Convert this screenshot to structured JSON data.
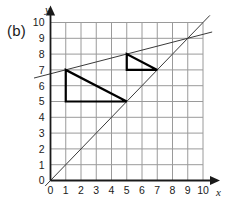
{
  "figure": {
    "panel_label": "(b)",
    "axis_x_name": "x",
    "axis_y_name": "y"
  },
  "chart_data": {
    "type": "scatter",
    "title": "(b)",
    "xlabel": "x",
    "ylabel": "y",
    "xlim": [
      0,
      10
    ],
    "ylim": [
      0,
      10
    ],
    "grid": true,
    "legend": "none",
    "x_ticks": [
      "0",
      "1",
      "2",
      "3",
      "4",
      "5",
      "6",
      "7",
      "8",
      "9",
      "10"
    ],
    "y_ticks": [
      "0",
      "1",
      "2",
      "3",
      "4",
      "5",
      "6",
      "7",
      "8",
      "9",
      "10"
    ],
    "x_tick_values": [
      0,
      1,
      2,
      3,
      4,
      5,
      6,
      7,
      8,
      9,
      10
    ],
    "y_tick_values": [
      0,
      1,
      2,
      3,
      4,
      5,
      6,
      7,
      8,
      9,
      10
    ],
    "shapes": [
      {
        "name": "large-triangle",
        "type": "polygon",
        "vertices": [
          [
            1,
            7
          ],
          [
            1,
            5
          ],
          [
            5,
            5
          ]
        ],
        "stroke": "#000000",
        "fill": "none",
        "stroke_width": 2.2
      },
      {
        "name": "small-triangle",
        "type": "polygon",
        "vertices": [
          [
            5,
            8
          ],
          [
            5,
            7
          ],
          [
            7,
            7
          ]
        ],
        "stroke": "#000000",
        "fill": "none",
        "stroke_width": 2.2
      }
    ],
    "series": [
      {
        "name": "steep-line",
        "type": "line",
        "equation": "y = x",
        "slope": 1,
        "intercept": 0,
        "points": [
          [
            -0.35,
            -0.35
          ],
          [
            10.45,
            10.45
          ]
        ],
        "stroke": "#3a3a3a",
        "stroke_width": 1
      },
      {
        "name": "shallow-line",
        "type": "line",
        "equation": "y = 0.25x + 6.75",
        "slope": 0.25,
        "intercept": 6.75,
        "points": [
          [
            -1.1,
            6.48
          ],
          [
            10.6,
            9.4
          ]
        ],
        "stroke": "#3a3a3a",
        "stroke_width": 1
      }
    ],
    "annotations": [
      {
        "name": "intersection",
        "point": [
          9,
          9
        ],
        "label": ""
      }
    ],
    "colors": {
      "grid": "#9a9a9a",
      "axis": "#1a1a1a",
      "shape_stroke": "#000000",
      "line_stroke": "#3a3a3a",
      "background": "#ffffff"
    }
  }
}
